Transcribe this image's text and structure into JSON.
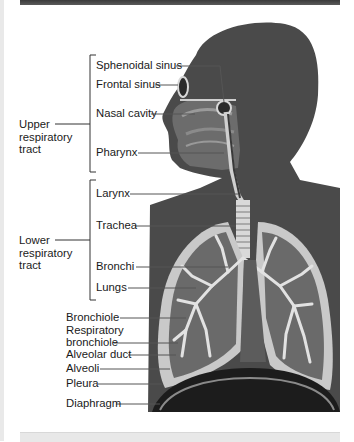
{
  "figure": {
    "groups": [
      {
        "lines": [
          "Upper",
          "respiratory",
          "tract"
        ]
      },
      {
        "lines": [
          "Lower",
          "respiratory",
          "tract"
        ]
      }
    ],
    "labels": [
      {
        "text": "Sphenoidal sinus"
      },
      {
        "text": "Frontal sinus"
      },
      {
        "text": "Nasal cavity"
      },
      {
        "text": "Pharynx"
      },
      {
        "text": "Larynx"
      },
      {
        "text": "Trachea"
      },
      {
        "text": "Bronchi"
      },
      {
        "text": "Lungs"
      },
      {
        "text": "Bronchiole"
      },
      {
        "text": "Respiratory"
      },
      {
        "text": "bronchiole"
      },
      {
        "text": "Alveolar duct"
      },
      {
        "text": "Alveoli"
      },
      {
        "text": "Pleura"
      },
      {
        "text": "Diaphragm"
      }
    ],
    "colors": {
      "silhouette": "#4a4a4a",
      "lung_outer": "#c9c9c9",
      "lung_inner": "#6a6a6a",
      "airway": "#d9d9d9",
      "diaphragm": "#1c1c1c",
      "leader": "#555555"
    }
  }
}
